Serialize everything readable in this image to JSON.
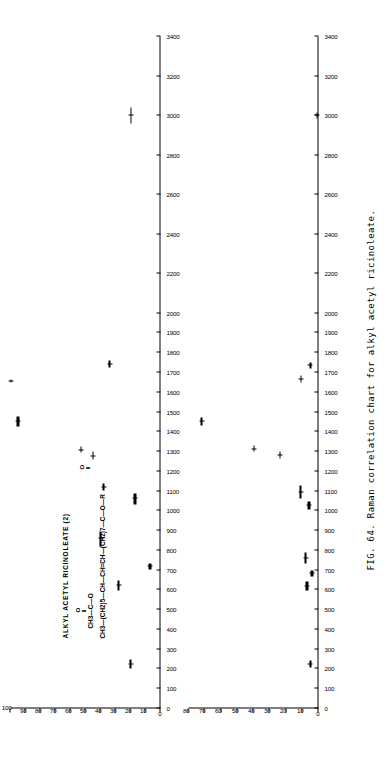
{
  "figure": {
    "caption": "FIG. 64.  Raman correlation chart for alkyl acetyl ricinoleate.",
    "caption_number": "FIG. 64.",
    "caption_text": "Raman correlation chart for alkyl acetyl ricinoleate."
  },
  "sample": {
    "name": "ALKYL  ACETYL  RICINOLEATE (2)",
    "formula_line1": "O",
    "formula_line2": "CH3—C—O",
    "formula_line3": "CH3—(CH2)5—CH—CH=CH—(CH2)7—C—O—R",
    "formula_carbonyl2": "O"
  },
  "chart_data": [
    {
      "id": "upper-panel",
      "type": "bar",
      "title": "ALKYL  ACETYL  RICINOLEATE (2)",
      "xlabel": "",
      "ylabel": "",
      "xlim": [
        0,
        3400
      ],
      "ylim": [
        0,
        100
      ],
      "grid": false,
      "legend": null,
      "orientation": "horizontal-rotated",
      "xticks": [
        0,
        100,
        200,
        300,
        400,
        500,
        600,
        700,
        800,
        900,
        1000,
        1100,
        1200,
        1300,
        1400,
        1500,
        1600,
        1700,
        1800,
        1900,
        2000,
        2200,
        2400,
        2600,
        2800,
        3000,
        3200,
        3400
      ],
      "xticklabels": [
        "0",
        "100",
        "200",
        "300",
        "400",
        "500",
        "600",
        "700",
        "800",
        "900",
        "1000",
        "1100",
        "1200",
        "1300",
        "1400",
        "1500",
        "1600",
        "1700",
        "1800",
        "1900",
        "2000",
        "2200",
        "2400",
        "2600",
        "2800",
        "3000",
        "3200",
        "3400"
      ],
      "yticks": [
        0,
        10,
        20,
        30,
        40,
        50,
        60,
        70,
        80,
        90,
        100
      ],
      "yticklabels": [
        "0",
        "10",
        "20",
        "30",
        "40",
        "50",
        "60",
        "70",
        "80",
        "90",
        "100"
      ],
      "bands": [
        {
          "x_center": 225,
          "x_min": 200,
          "x_max": 250,
          "height": 20,
          "weight": "heavy"
        },
        {
          "x_center": 620,
          "x_min": 595,
          "x_max": 650,
          "height": 28,
          "weight": "heavy"
        },
        {
          "x_center": 720,
          "x_min": 705,
          "x_max": 735,
          "height": 7,
          "weight": "heavy"
        },
        {
          "x_center": 860,
          "x_min": 820,
          "x_max": 895,
          "height": 40,
          "weight": "heavy"
        },
        {
          "x_center": 1060,
          "x_min": 1030,
          "x_max": 1090,
          "height": 17,
          "weight": "heavy"
        },
        {
          "x_center": 1120,
          "x_min": 1105,
          "x_max": 1140,
          "height": 38,
          "weight": "heavy"
        },
        {
          "x_center": 1275,
          "x_min": 1260,
          "x_max": 1300,
          "height": 45,
          "weight": "light"
        },
        {
          "x_center": 1305,
          "x_min": 1295,
          "x_max": 1325,
          "height": 53,
          "weight": "light"
        },
        {
          "x_center": 1450,
          "x_min": 1425,
          "x_max": 1478,
          "height": 95,
          "weight": "heavy"
        },
        {
          "x_center": 1655,
          "x_min": 1648,
          "x_max": 1665,
          "height": 100,
          "weight": "light"
        },
        {
          "x_center": 1740,
          "x_min": 1725,
          "x_max": 1760,
          "height": 34,
          "weight": "heavy"
        },
        {
          "x_center": 3000,
          "x_min": 2960,
          "x_max": 3040,
          "height": 20,
          "weight": "light"
        }
      ]
    },
    {
      "id": "lower-panel",
      "type": "bar",
      "title": "",
      "xlabel": "",
      "ylabel": "",
      "xlim": [
        0,
        3400
      ],
      "ylim": [
        0,
        80
      ],
      "grid": false,
      "legend": null,
      "orientation": "horizontal-rotated",
      "xticks": [
        0,
        100,
        200,
        300,
        400,
        500,
        600,
        700,
        800,
        900,
        1000,
        1100,
        1200,
        1300,
        1400,
        1500,
        1600,
        1700,
        1800,
        1900,
        2000,
        2200,
        2400,
        2600,
        2800,
        3000,
        3200,
        3400
      ],
      "xticklabels": [
        "0",
        "100",
        "200",
        "300",
        "400",
        "500",
        "600",
        "700",
        "800",
        "900",
        "1000",
        "1100",
        "1200",
        "1300",
        "1400",
        "1500",
        "1600",
        "1700",
        "1800",
        "1900",
        "2000",
        "2200",
        "2400",
        "2600",
        "2800",
        "3000",
        "3200",
        "3400"
      ],
      "yticks": [
        0,
        10,
        20,
        30,
        40,
        50,
        60,
        70,
        80
      ],
      "yticklabels": [
        "0",
        "10",
        "20",
        "30",
        "40",
        "50",
        "60",
        "70",
        "80"
      ],
      "bands": [
        {
          "x_center": 225,
          "x_min": 205,
          "x_max": 245,
          "height": 5,
          "weight": "heavy"
        },
        {
          "x_center": 615,
          "x_min": 595,
          "x_max": 645,
          "height": 7,
          "weight": "heavy"
        },
        {
          "x_center": 685,
          "x_min": 670,
          "x_max": 700,
          "height": 4,
          "weight": "heavy"
        },
        {
          "x_center": 760,
          "x_min": 735,
          "x_max": 790,
          "height": 8,
          "weight": "heavy"
        },
        {
          "x_center": 1025,
          "x_min": 1005,
          "x_max": 1045,
          "height": 6,
          "weight": "heavy"
        },
        {
          "x_center": 1095,
          "x_min": 1060,
          "x_max": 1130,
          "height": 11,
          "weight": "heavy"
        },
        {
          "x_center": 1280,
          "x_min": 1265,
          "x_max": 1300,
          "height": 24,
          "weight": "light"
        },
        {
          "x_center": 1310,
          "x_min": 1298,
          "x_max": 1330,
          "height": 40,
          "weight": "light"
        },
        {
          "x_center": 1450,
          "x_min": 1432,
          "x_max": 1470,
          "height": 72,
          "weight": "heavy"
        },
        {
          "x_center": 1665,
          "x_min": 1650,
          "x_max": 1685,
          "height": 11,
          "weight": "light"
        },
        {
          "x_center": 1735,
          "x_min": 1722,
          "x_max": 1752,
          "height": 5,
          "weight": "heavy"
        },
        {
          "x_center": 3000,
          "x_min": 2985,
          "x_max": 3015,
          "height": 1,
          "weight": "light"
        }
      ]
    }
  ]
}
